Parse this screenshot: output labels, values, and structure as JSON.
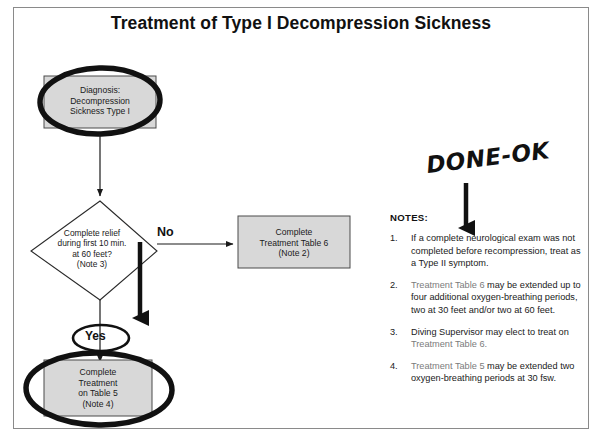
{
  "document": {
    "title": "Treatment of Type I Decompression Sickness"
  },
  "flowchart": {
    "nodes": {
      "diagnosis": {
        "lines": [
          "Diagnosis:",
          "Decompression",
          "Sickness Type I"
        ],
        "shape": "rectangle",
        "fill": "#d8d8d8",
        "annotation": "circled"
      },
      "decision": {
        "lines": [
          "Complete relief",
          "during first 10 min.",
          "at 60 feet?",
          "(Note 3)"
        ],
        "shape": "diamond",
        "fill": "#ffffff"
      },
      "table6": {
        "lines": [
          "Complete",
          "Treatment Table 6",
          "(Note 2)"
        ],
        "shape": "rectangle",
        "fill": "#d8d8d8"
      },
      "table5": {
        "lines": [
          "Complete",
          "Treatment",
          "on Table 5",
          "(Note 4)"
        ],
        "shape": "rectangle",
        "fill": "#d8d8d8",
        "annotation": "circled"
      }
    },
    "edges": {
      "no_label": "No",
      "yes_label": "Yes"
    }
  },
  "annotation": {
    "handwritten_text": "DONE-OK",
    "arrow": "down-arrow"
  },
  "notes": {
    "heading": "NOTES:",
    "items": [
      {
        "number": "1.",
        "text": "If a complete neurological exam was not completed before recompression, treat as a Type II symptom."
      },
      {
        "number": "2.",
        "ref": "Treatment Table 6",
        "text": " may be extended up to four additional oxygen-breathing periods, two at 30 feet and/or two at 60 feet."
      },
      {
        "number": "3.",
        "text": "Diving Supervisor may elect to treat on ",
        "ref_tail": "Treatment Table 6."
      },
      {
        "number": "4.",
        "ref": "Treatment Table 5",
        "text": " may be extended two oxygen-breathing periods at 30 fsw."
      }
    ]
  },
  "colors": {
    "node_fill": "#d8d8d8",
    "line": "#1a1a1a",
    "frame": "#8a8a8a",
    "ref_text": "#7b7b7b"
  }
}
